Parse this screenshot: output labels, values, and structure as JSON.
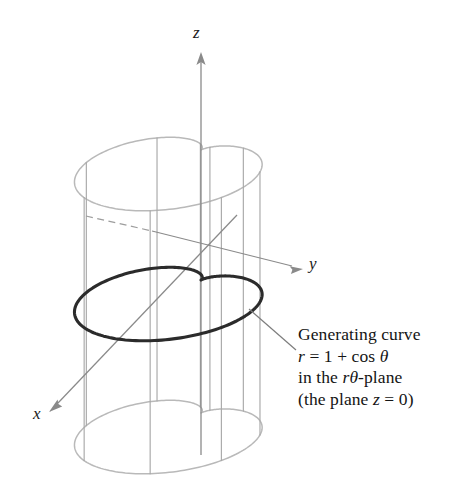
{
  "figure": {
    "kind": "3d-cylinder-cardioid-diagram",
    "background_color": "#ffffff",
    "axes": {
      "z": {
        "label": "z",
        "direction": "up",
        "arrow": true
      },
      "y": {
        "label": "y",
        "direction": "right-down",
        "arrow": true
      },
      "x": {
        "label": "x",
        "direction": "left-down",
        "arrow": true
      },
      "axis_color": "#8a8a8a",
      "origin": {
        "x": 201,
        "y": 249
      }
    },
    "surface": {
      "name": "cylinder-over-cardioid",
      "curve_color": "#b9b9b9",
      "ruling_color": "#a8a8a8",
      "top_ellipse_center_y": 150,
      "bottom_ellipse_center_y": 413,
      "ruling_count": 6
    },
    "generating_curve": {
      "name": "cardioid",
      "equation": "r = 1 + cos(theta)",
      "color": "#2b2b2b",
      "line_width": 3.1,
      "plane": "z = 0",
      "center_y": 280
    },
    "leader_line": {
      "color": "#7d7d7d",
      "from": {
        "x": 296,
        "y": 350
      },
      "to": {
        "x": 249,
        "y": 309
      }
    }
  },
  "annotation": {
    "line1": "Generating curve",
    "line2_r": "r",
    "line2_rest": " = 1 + cos ",
    "line2_theta": "θ",
    "line3_pre": "in the ",
    "line3_r": "r",
    "line3_theta": "θ",
    "line3_post": "-plane",
    "line4_pre": "(the plane ",
    "line4_z": "z",
    "line4_post": " = 0)"
  },
  "axis_labels": {
    "z": "z",
    "y": "y",
    "x": "x"
  },
  "chart_data": {
    "type": "line",
    "xlabel": "x",
    "ylabel": "y",
    "zlabel": "z",
    "curves": [
      {
        "name": "generating-curve-cardioid",
        "equation": "r = 1 + cos(theta)",
        "plane": "z = 0",
        "theta_range_deg": [
          0,
          360
        ],
        "r_at_theta": {
          "0": 2.0,
          "30": 1.866,
          "60": 1.5,
          "90": 1.0,
          "120": 0.5,
          "150": 0.134,
          "180": 0.0,
          "210": 0.134,
          "240": 0.5,
          "270": 1.0,
          "300": 1.5,
          "330": 1.866,
          "360": 2.0
        },
        "color": "#2b2b2b"
      },
      {
        "name": "top-rim-cardioid",
        "equation": "r = 1 + cos(theta)",
        "plane": "z = z_top",
        "color": "#b9b9b9"
      },
      {
        "name": "bottom-rim-cardioid",
        "equation": "r = 1 + cos(theta)",
        "plane": "z = z_bottom",
        "color": "#b9b9b9"
      }
    ],
    "grid": false,
    "legend": "none"
  }
}
